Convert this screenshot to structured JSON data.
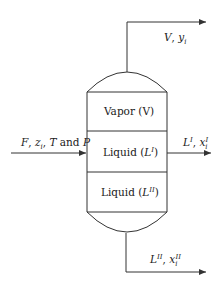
{
  "diagram": {
    "type": "three-phase flash separator",
    "colors": {
      "stroke": "#333333",
      "text": "#222222",
      "background": "#ffffff"
    },
    "vessel": {
      "zones": [
        {
          "id": "vapor",
          "label": "Vapor (V)"
        },
        {
          "id": "liquid1",
          "label_prefix": "Liquid (",
          "label_symbol": "L",
          "label_sup": "I",
          "label_suffix": ")"
        },
        {
          "id": "liquid2",
          "label_prefix": "Liquid (",
          "label_symbol": "L",
          "label_sup": "II",
          "label_suffix": ")"
        }
      ]
    },
    "streams": {
      "feed": {
        "symbol": "F",
        "comp": "z",
        "comp_sub": "i",
        "tail": "T",
        "and": "and",
        "p": "P"
      },
      "vapor_out": {
        "symbol": "V",
        "comp": "y",
        "comp_sub": "i"
      },
      "liquid1_out": {
        "symbol": "L",
        "sup": "I",
        "comp": "x",
        "comp_sub": "i",
        "comp_sup": "I"
      },
      "liquid2_out": {
        "symbol": "L",
        "sup": "II",
        "comp": "x",
        "comp_sub": "i",
        "comp_sup": "II"
      }
    }
  }
}
